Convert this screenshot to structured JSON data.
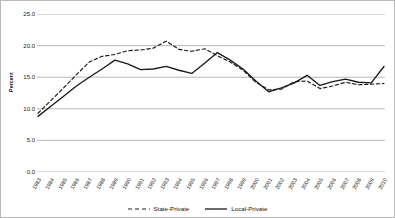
{
  "chart_data": {
    "type": "line",
    "title": "",
    "xlabel": "",
    "ylabel": "Percent",
    "ylim": [
      0.0,
      25.0
    ],
    "yticks": [
      "0.0",
      "5.0",
      "10.0",
      "15.0",
      "20.0",
      "25.0"
    ],
    "ytick_values": [
      0.0,
      5.0,
      10.0,
      15.0,
      20.0,
      25.0
    ],
    "grid": "horizontal",
    "legend_position": "bottom",
    "categories": [
      "1983",
      "1984",
      "1985",
      "1986",
      "1987",
      "1988",
      "1989",
      "1990",
      "1991",
      "1992",
      "1993",
      "1994",
      "1995",
      "1996",
      "1997",
      "1998",
      "1999",
      "2000",
      "2001",
      "2002",
      "2003",
      "2004",
      "2005",
      "2006",
      "2007",
      "2008",
      "2009",
      "2010"
    ],
    "series": [
      {
        "name": "State-Private",
        "style": "dashed",
        "color": "#1a1a1a",
        "values": [
          9.3,
          11.3,
          13.3,
          15.4,
          17.4,
          18.3,
          18.6,
          19.2,
          19.3,
          19.6,
          20.7,
          19.4,
          19.1,
          19.5,
          18.4,
          17.4,
          16.1,
          14.2,
          13.0,
          13.1,
          14.3,
          14.4,
          13.2,
          13.6,
          14.2,
          13.8,
          13.9,
          14.0
        ]
      },
      {
        "name": "Local-Private",
        "style": "solid",
        "color": "#1a1a1a",
        "values": [
          8.8,
          10.4,
          12.0,
          13.6,
          15.0,
          16.3,
          17.7,
          17.1,
          16.2,
          16.3,
          16.7,
          16.1,
          15.6,
          17.2,
          18.9,
          17.7,
          16.3,
          14.4,
          12.7,
          13.3,
          14.1,
          15.3,
          13.7,
          14.3,
          14.7,
          14.2,
          14.1,
          16.7
        ]
      }
    ],
    "legend": [
      {
        "label": "State-Private",
        "style": "dashed"
      },
      {
        "label": "Local-Private",
        "style": "solid"
      }
    ]
  }
}
